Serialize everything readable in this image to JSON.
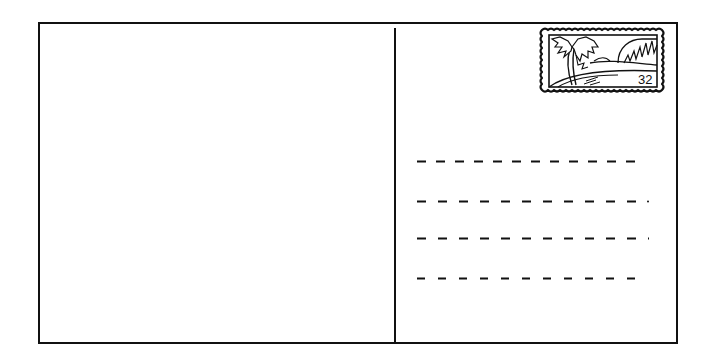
{
  "postcard": {
    "border_color": "#111111",
    "background_color": "#ffffff"
  },
  "stamp": {
    "icon": "beach-palm-trees-stamp-icon",
    "value": "32"
  },
  "address_lines": [
    {
      "y": 160,
      "x_start": 417,
      "x_end": 643,
      "dash_count": 12
    },
    {
      "y": 200,
      "x_start": 417,
      "x_end": 648,
      "dash_count": 11
    },
    {
      "y": 237,
      "x_start": 417,
      "x_end": 648,
      "dash_count": 11
    },
    {
      "y": 277,
      "x_start": 417,
      "x_end": 645,
      "dash_count": 11
    }
  ]
}
